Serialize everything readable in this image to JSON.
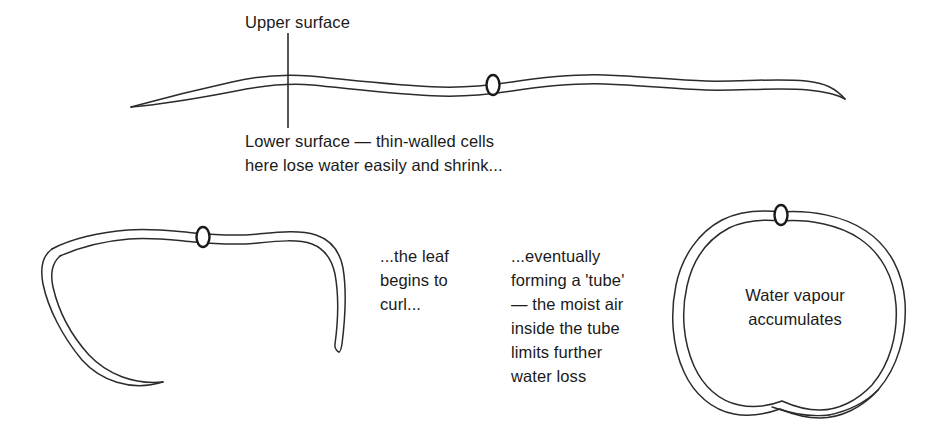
{
  "figure": {
    "title_text": "",
    "background_color": "#ffffff",
    "ink_color": "#1a1a1a",
    "stroke_color": "#2b2b2b"
  },
  "labels": {
    "upper_surface": "Upper surface",
    "lower_surface": "Lower surface — thin-walled cells\nhere lose water easily and shrink...",
    "leaf_curls": "...the leaf\nbegins to\ncurl...",
    "tube_forms": "...eventually\nforming a 'tube'\n— the moist air\ninside the tube\nlimits further\nwater loss",
    "water_vapour": "Water vapour\naccumulates"
  },
  "panels": [
    {
      "id": "flat-leaf",
      "name": "flat leaf cross-section",
      "stoma_count": 2
    },
    {
      "id": "curled-leaf",
      "name": "partially curled leaf cross-section",
      "stoma_count": 1
    },
    {
      "id": "tube-leaf",
      "name": "rolled leaf tube cross-section",
      "stoma_count": 1
    }
  ],
  "annotations": {
    "leader_line": "vertical leader from Upper surface label through leaf to Lower surface label"
  }
}
